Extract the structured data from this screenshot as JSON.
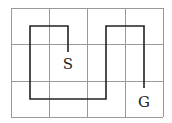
{
  "diagram": {
    "type": "grid-path",
    "grid": {
      "cols": 4,
      "rows": 3,
      "x": [
        11,
        49,
        87,
        125,
        163
      ],
      "y": [
        8,
        44,
        81,
        117
      ]
    },
    "path_points": [
      [
        68,
        52
      ],
      [
        68,
        26
      ],
      [
        30,
        26
      ],
      [
        30,
        99
      ],
      [
        106,
        99
      ],
      [
        106,
        26
      ],
      [
        144,
        26
      ],
      [
        144,
        88
      ]
    ],
    "labels": {
      "start": "S",
      "goal": "G"
    },
    "colors": {
      "grid": "#999999",
      "path": "#222222"
    }
  }
}
